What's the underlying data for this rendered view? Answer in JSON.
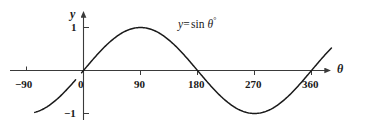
{
  "chart_data": {
    "type": "line",
    "title": "",
    "subtitle": "",
    "xlabel": "θ",
    "ylabel": "y",
    "equation_label": {
      "lhs": "y",
      "equals": "=",
      "func": "sin",
      "variable": "θ",
      "degree": "°",
      "full": "y = sin θ°"
    },
    "xlim": [
      -112,
      400
    ],
    "ylim": [
      -1.45,
      1.5
    ],
    "xticks": [
      -90,
      0,
      90,
      180,
      270,
      360
    ],
    "xticklabels": [
      "−90",
      "0",
      "90",
      "180",
      "270",
      "360"
    ],
    "yticks": [
      1,
      -1
    ],
    "yticklabels": [
      "1",
      "−1"
    ],
    "grid": false,
    "legend": "none",
    "series": [
      {
        "name": "y = sin θ°",
        "color": "#1a1a1a",
        "domain_degrees": [
          -77,
          392
        ],
        "gap_degrees": [
          -12,
          -3
        ],
        "x": [
          -77,
          -70,
          -60,
          -50,
          -40,
          -30,
          -20,
          -12,
          -3,
          0,
          10,
          20,
          30,
          40,
          50,
          60,
          70,
          80,
          90,
          100,
          110,
          120,
          130,
          140,
          150,
          160,
          170,
          180,
          190,
          200,
          210,
          220,
          230,
          240,
          250,
          260,
          270,
          280,
          290,
          300,
          310,
          320,
          330,
          340,
          350,
          360,
          370,
          380,
          392
        ],
        "y": [
          -0.974,
          -0.94,
          -0.866,
          -0.766,
          -0.643,
          -0.5,
          -0.342,
          -0.208,
          -0.052,
          0.0,
          0.174,
          0.342,
          0.5,
          0.643,
          0.766,
          0.866,
          0.94,
          0.985,
          1.0,
          0.985,
          0.94,
          0.866,
          0.766,
          0.643,
          0.5,
          0.342,
          0.174,
          0.0,
          -0.174,
          -0.342,
          -0.5,
          -0.643,
          -0.766,
          -0.866,
          -0.94,
          -0.985,
          -1.0,
          -0.985,
          -0.94,
          -0.866,
          -0.766,
          -0.643,
          -0.5,
          -0.342,
          -0.174,
          0.0,
          0.174,
          0.342,
          0.616
        ]
      }
    ],
    "axis_arrows": [
      "x-right",
      "y-up"
    ],
    "line_color": "#1a1a1a",
    "axis_color": "#3a3a3a",
    "background": "#ffffff"
  },
  "axes": {
    "y_axis_name": "y",
    "x_axis_name": "θ"
  },
  "labels": {
    "x_neg90": "−90",
    "x_0": "0",
    "x_90": "90",
    "x_180": "180",
    "x_270": "270",
    "x_360": "360",
    "y_pos1": "1",
    "y_neg1": "−1"
  }
}
